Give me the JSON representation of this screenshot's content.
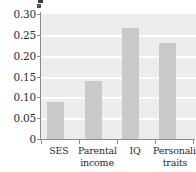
{
  "chart_data": {
    "type": "bar",
    "title": "",
    "subtitle": "",
    "xlabel": "",
    "ylabel": "",
    "categories": [
      "SES",
      "Parental income",
      "IQ",
      "Personality traits"
    ],
    "values": [
      0.089,
      0.139,
      0.266,
      0.23
    ],
    "series": [
      {
        "name": "",
        "values": [
          0.089,
          0.139,
          0.266,
          0.23
        ]
      }
    ],
    "ylim": [
      0,
      0.3
    ],
    "yticks": [
      0,
      0.05,
      0.1,
      0.15,
      0.2,
      0.25,
      0.3
    ],
    "ytick_labels": [
      "0",
      "0.05",
      "0.10",
      "0.15",
      "0.20",
      "0.25",
      "0.30"
    ],
    "grid": true,
    "grid_axis": "y",
    "legend": false,
    "legend_position": "none",
    "bar_color": "#c9c9c9",
    "plot_background": "#ececec",
    "gridline_color": "#fdfdfd",
    "axis_color": "#8d8d8d",
    "text_color": "#2b2b2b"
  },
  "axis": {
    "y": {
      "labels": [
        {
          "text": "0.30",
          "value": 0.3
        },
        {
          "text": "0.25",
          "value": 0.25
        },
        {
          "text": "0.20",
          "value": 0.2
        },
        {
          "text": "0.15",
          "value": 0.15
        },
        {
          "text": "0.10",
          "value": 0.1
        },
        {
          "text": "0.05",
          "value": 0.05
        },
        {
          "text": "0",
          "value": 0
        }
      ]
    },
    "x": {
      "labels": [
        {
          "line1": "SES",
          "line2": ""
        },
        {
          "line1": "Parental",
          "line2": "income"
        },
        {
          "line1": "IQ",
          "line2": ""
        },
        {
          "line1": "Personality",
          "line2": "traits"
        }
      ]
    }
  }
}
